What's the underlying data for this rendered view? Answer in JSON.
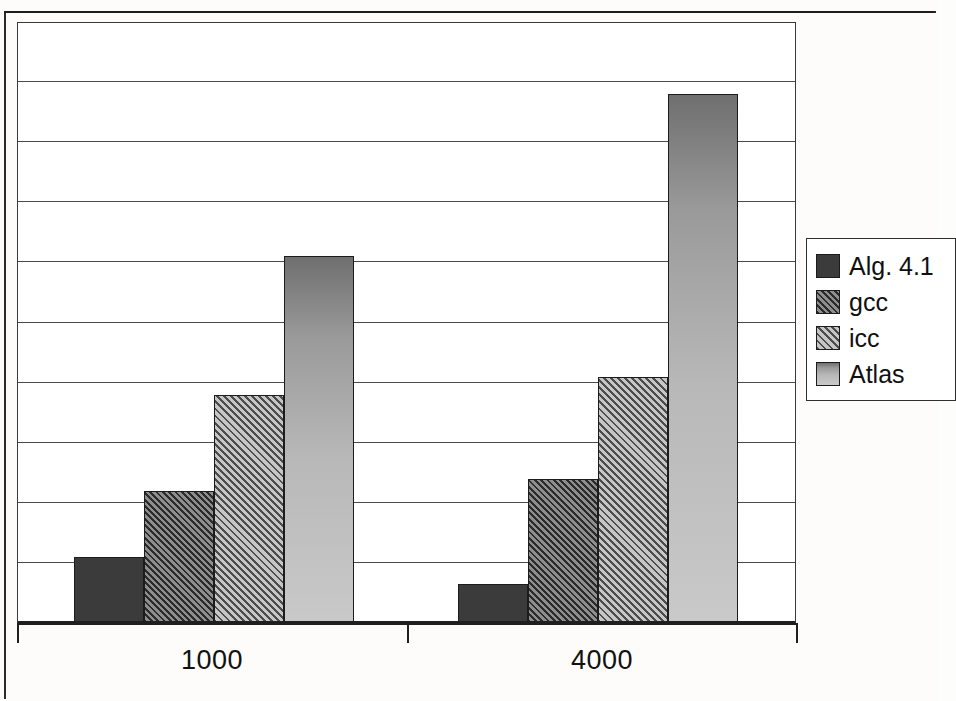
{
  "chart_data": {
    "type": "bar",
    "title": "",
    "subtitle": "",
    "xlabel": "",
    "ylabel": "",
    "categories": [
      "1000",
      "4000"
    ],
    "series": [
      {
        "name": "Alg. 4.1",
        "values": [
          1.1,
          0.65
        ],
        "swatch": "solid-dark",
        "color": "#3b3b3b"
      },
      {
        "name": "gcc",
        "values": [
          2.2,
          2.4
        ],
        "swatch": "hatch-dark",
        "color": "#565656"
      },
      {
        "name": "icc",
        "values": [
          3.8,
          4.1
        ],
        "swatch": "hatch-light",
        "color": "#8d8d8d"
      },
      {
        "name": "Atlas",
        "values": [
          6.1,
          8.8
        ],
        "swatch": "solid-light",
        "color": "#b8b8b8"
      }
    ],
    "ylim": [
      0,
      10
    ],
    "y_gridline_values": [
      1,
      2,
      3,
      4,
      5,
      6,
      7,
      8,
      9
    ],
    "y_tick_labels": [],
    "grid": true,
    "grid_axis": "y",
    "legend": true,
    "legend_position": "right",
    "legend_entries": [
      "Alg. 4.1",
      "gcc",
      "icc",
      "Atlas"
    ],
    "annotations": []
  },
  "axis": {
    "x_labels": [
      "1000",
      "4000"
    ],
    "y_labels": []
  },
  "legend": {
    "entries": [
      {
        "label": "Alg. 4.1"
      },
      {
        "label": "gcc"
      },
      {
        "label": "icc"
      },
      {
        "label": "Atlas"
      }
    ]
  }
}
